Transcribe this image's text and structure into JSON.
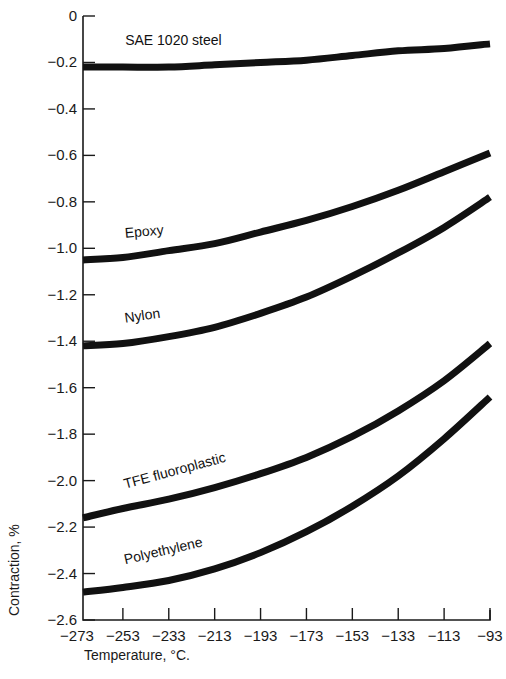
{
  "chart_data": {
    "type": "line",
    "title": "",
    "xlabel": "Temperature, °C.",
    "ylabel": "Contraction, %",
    "x": [
      -273,
      -253,
      -233,
      -213,
      -193,
      -173,
      -153,
      -133,
      -113,
      -93
    ],
    "xlim": [
      -273,
      -93
    ],
    "ylim": [
      -2.6,
      0
    ],
    "x_ticks": [
      "-273",
      "-253",
      "-233",
      "-213",
      "-193",
      "-173",
      "-153",
      "-133",
      "-113",
      "-93"
    ],
    "y_ticks": [
      "0",
      "-0.2",
      "-0.4",
      "-0.6",
      "-0.8",
      "-1.0",
      "-1.2",
      "-1.4",
      "-1.6",
      "-1.8",
      "-2.0",
      "-2.2",
      "-2.4",
      "-2.6"
    ],
    "y_tick_values": [
      0,
      -0.2,
      -0.4,
      -0.6,
      -0.8,
      -1.0,
      -1.2,
      -1.4,
      -1.6,
      -1.8,
      -2.0,
      -2.2,
      -2.4,
      -2.6
    ],
    "grid": false,
    "legend": "inline labels on curves",
    "series": [
      {
        "name": "SAE 1020 steel",
        "values": [
          -0.22,
          -0.22,
          -0.22,
          -0.21,
          -0.2,
          -0.19,
          -0.17,
          -0.15,
          -0.14,
          -0.12
        ],
        "label_at": [
          -252,
          -0.125
        ],
        "label_angle": 0
      },
      {
        "name": "Epoxy",
        "values": [
          -1.05,
          -1.04,
          -1.01,
          -0.98,
          -0.93,
          -0.88,
          -0.82,
          -0.75,
          -0.67,
          -0.59
        ],
        "label_at": [
          -252,
          -0.955
        ],
        "label_angle": -5
      },
      {
        "name": "Nylon",
        "values": [
          -1.42,
          -1.41,
          -1.38,
          -1.34,
          -1.28,
          -1.21,
          -1.12,
          -1.02,
          -0.91,
          -0.78
        ],
        "label_at": [
          -252,
          -1.32
        ],
        "label_angle": -8
      },
      {
        "name": "TFE fluoroplastic",
        "values": [
          -2.16,
          -2.12,
          -2.08,
          -2.03,
          -1.97,
          -1.9,
          -1.81,
          -1.7,
          -1.57,
          -1.41
        ],
        "label_at": [
          -252,
          -2.035
        ],
        "label_angle": -15
      },
      {
        "name": "Polyethylene",
        "values": [
          -2.48,
          -2.46,
          -2.43,
          -2.38,
          -2.31,
          -2.22,
          -2.11,
          -1.98,
          -1.82,
          -1.64
        ],
        "label_at": [
          -252,
          -2.36
        ],
        "label_angle": -13
      }
    ]
  },
  "layout": {
    "plot_left_px": 77,
    "plot_right_px": 490,
    "plot_top_px": 16,
    "plot_bottom_px": 620,
    "y_axis_x_px": 83
  }
}
